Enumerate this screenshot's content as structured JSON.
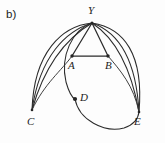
{
  "figure": {
    "panel_label": "b)",
    "background_color": "#fdfdfd",
    "stroke_color": "#2b2b2b",
    "label_color": "#1c1c1c",
    "width": 165,
    "height": 143,
    "vertices": [
      {
        "id": "Y",
        "label": "Y",
        "x": 92,
        "y": 23,
        "dot": false
      },
      {
        "id": "A",
        "label": "A",
        "x": 72,
        "y": 56,
        "dot": true
      },
      {
        "id": "B",
        "label": "B",
        "x": 108,
        "y": 56,
        "dot": true
      },
      {
        "id": "C",
        "label": "C",
        "x": 32,
        "y": 110,
        "dot": false
      },
      {
        "id": "D",
        "label": "D",
        "x": 75,
        "y": 99,
        "dot": true
      },
      {
        "id": "E",
        "label": "E",
        "x": 139,
        "y": 112,
        "dot": false
      }
    ],
    "edges": [
      {
        "from": "Y",
        "to": "C",
        "kind": "arc-outer-left"
      },
      {
        "from": "Y",
        "to": "C",
        "kind": "arc-mid-left"
      },
      {
        "from": "Y",
        "to": "C",
        "kind": "arc-inner-left"
      },
      {
        "from": "A",
        "to": "C",
        "kind": "arc-short-left"
      },
      {
        "from": "Y",
        "to": "A",
        "kind": "straight"
      },
      {
        "from": "A",
        "to": "B",
        "kind": "straight-horizontal"
      },
      {
        "from": "Y",
        "to": "B",
        "kind": "straight"
      },
      {
        "from": "Y",
        "to": "E",
        "kind": "arc-inner-right"
      },
      {
        "from": "Y",
        "to": "E",
        "kind": "arc-mid-right"
      },
      {
        "from": "Y",
        "to": "E",
        "kind": "arc-outer-right"
      },
      {
        "from": "B",
        "to": "E",
        "kind": "arc-short-right"
      },
      {
        "from": "Y",
        "to": "D",
        "kind": "arc-through-D"
      },
      {
        "from": "D",
        "to": "E",
        "kind": "arc-bottom"
      }
    ]
  }
}
